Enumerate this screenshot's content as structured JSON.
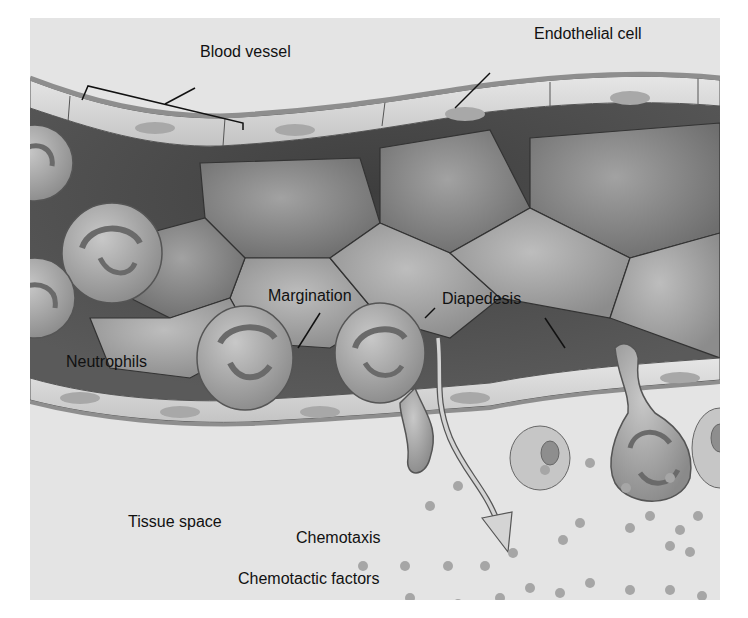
{
  "figure": {
    "type": "labeled-illustration"
  },
  "labels": {
    "blood_vessel": "Blood vessel",
    "endothelial_cell": "Endothelial cell",
    "margination": "Margination",
    "diapedesis": "Diapedesis",
    "neutrophils": "Neutrophils",
    "tissue_space": "Tissue space",
    "chemotaxis": "Chemotaxis",
    "chemotactic_factors": "Chemotactic factors"
  },
  "colors": {
    "background": "#e6e6e6",
    "vessel_wall": "#9a9a9a",
    "endothelium": "#d8d8d8",
    "lumen_dark": "#4a4a4a",
    "red_cell": "#8a8a8a",
    "neutrophil": "#b4b4b4",
    "chemotactic_factor": "#a8a8a8",
    "label_text": "#111111"
  }
}
